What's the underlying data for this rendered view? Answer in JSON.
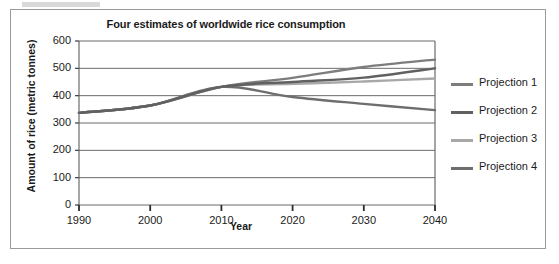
{
  "figure": {
    "background_color": "#ffffff",
    "border_color": "#9a9a9a"
  },
  "chart_data": {
    "type": "line",
    "title": "Four estimates of worldwide rice consumption",
    "xlabel": "Year",
    "ylabel": "Amount of rice (metric tonnes)",
    "xlim": [
      1990,
      2040
    ],
    "ylim": [
      0,
      600
    ],
    "grid": true,
    "grid_axis": "y",
    "legend_position": "right",
    "xticks": [
      "1990",
      "2000",
      "2010",
      "2020",
      "2030",
      "2040"
    ],
    "yticks": [
      "0",
      "100",
      "200",
      "300",
      "400",
      "500",
      "600"
    ],
    "x": [
      1990,
      2000,
      2010,
      2020,
      2030,
      2040
    ],
    "series": [
      {
        "name": "Projection 1",
        "color": "#7d7d7d",
        "values": [
          337,
          364,
          432,
          465,
          505,
          532
        ]
      },
      {
        "name": "Projection 2",
        "color": "#616161",
        "values": [
          337,
          364,
          432,
          450,
          466,
          500
        ]
      },
      {
        "name": "Projection 3",
        "color": "#a8a8a8",
        "values": [
          337,
          364,
          432,
          443,
          452,
          463
        ]
      },
      {
        "name": "Projection 4",
        "color": "#6e6e6e",
        "values": [
          337,
          364,
          432,
          395,
          370,
          347
        ]
      }
    ]
  },
  "legend": {
    "items": [
      {
        "label": "Projection 1",
        "color": "#7d7d7d"
      },
      {
        "label": "Projection 2",
        "color": "#616161"
      },
      {
        "label": "Projection 3",
        "color": "#a8a8a8"
      },
      {
        "label": "Projection 4",
        "color": "#6e6e6e"
      }
    ]
  }
}
